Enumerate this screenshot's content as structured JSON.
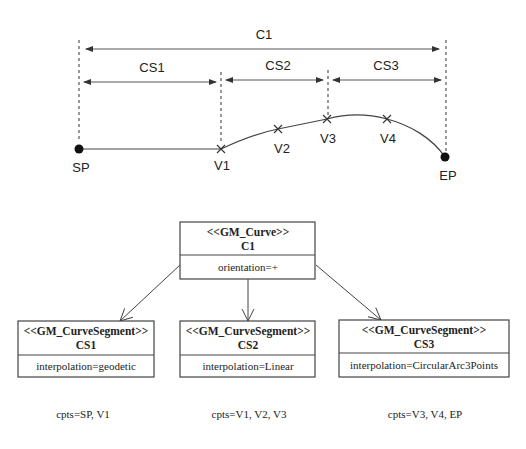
{
  "top_diagram": {
    "curve_label": "C1",
    "segments": [
      {
        "label": "CS1"
      },
      {
        "label": "CS2"
      },
      {
        "label": "CS3"
      }
    ],
    "points": {
      "start": "SP",
      "end": "EP",
      "vertices": [
        "V1",
        "V2",
        "V3",
        "V4"
      ]
    }
  },
  "uml": {
    "curve": {
      "stereotype": "<<GM_Curve>>",
      "name": "C1",
      "attribute": "orientation=+"
    },
    "segments": [
      {
        "stereotype": "<<GM_CurveSegment>>",
        "name": "CS1",
        "attribute": "interpolation=geodetic",
        "cpts": "cpts=SP, V1"
      },
      {
        "stereotype": "<<GM_CurveSegment>>",
        "name": "CS2",
        "attribute": "interpolation=Linear",
        "cpts": "cpts=V1, V2, V3"
      },
      {
        "stereotype": "<<GM_CurveSegment>>",
        "name": "CS3",
        "attribute": "interpolation=CircularArc3Points",
        "cpts": "cpts=V3, V4, EP"
      }
    ]
  }
}
